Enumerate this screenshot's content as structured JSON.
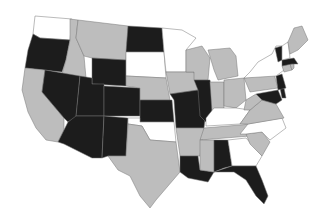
{
  "map": {
    "type": "choropleth",
    "region": "United States (contiguous)",
    "categories": {
      "white": "#ffffff",
      "gray": "#bdbdbd",
      "black": "#1c1c1c"
    },
    "states": [
      {
        "id": "WA",
        "cat": "white",
        "d": "M35,16 L72,19 L70,40 L40,38 L33,34 Z"
      },
      {
        "id": "OR",
        "cat": "black",
        "d": "M33,34 L40,38 L70,40 L66,60 L62,72 L25,68 L28,50 Z"
      },
      {
        "id": "CA",
        "cat": "gray",
        "d": "M25,68 L45,70 L42,92 L64,118 L64,130 L58,142 L46,140 L36,128 L28,112 L22,90 Z"
      },
      {
        "id": "ID",
        "cat": "gray",
        "d": "M70,19 L78,20 L76,38 L84,56 L86,78 L62,74 L66,60 L70,40 Z"
      },
      {
        "id": "NV",
        "cat": "black",
        "d": "M45,70 L80,76 L76,118 L68,122 L64,118 L42,92 Z"
      },
      {
        "id": "MT",
        "cat": "gray",
        "d": "M78,20 L128,26 L126,60 L92,58 L84,56 L76,38 Z"
      },
      {
        "id": "WY",
        "cat": "black",
        "d": "M92,58 L126,60 L126,86 L92,84 Z"
      },
      {
        "id": "UT",
        "cat": "black",
        "d": "M80,76 L92,78 L92,84 L104,84 L104,116 L76,116 Z"
      },
      {
        "id": "AZ",
        "cat": "black",
        "d": "M76,116 L104,116 L102,158 L92,158 L64,144 L58,142 L64,130 L68,122 Z"
      },
      {
        "id": "CO",
        "cat": "black",
        "d": "M104,86 L140,88 L140,116 L104,116 Z"
      },
      {
        "id": "NM",
        "cat": "black",
        "d": "M104,116 L128,118 L126,156 L108,156 L102,158 Z"
      },
      {
        "id": "ND",
        "cat": "black",
        "d": "M128,26 L162,28 L164,52 L126,52 Z"
      },
      {
        "id": "SD",
        "cat": "white",
        "d": "M126,52 L164,52 L166,78 L126,76 Z"
      },
      {
        "id": "NE",
        "cat": "gray",
        "d": "M126,76 L166,78 L170,100 L140,100 L140,88 L126,86 Z"
      },
      {
        "id": "KS",
        "cat": "black",
        "d": "M140,100 L172,100 L174,122 L140,122 Z"
      },
      {
        "id": "OK",
        "cat": "white",
        "d": "M128,118 L140,118 L140,122 L174,122 L176,142 L150,140 L142,126 L128,124 Z"
      },
      {
        "id": "TX",
        "cat": "gray",
        "d": "M128,124 L142,126 L150,140 L176,142 L180,172 L168,186 L156,200 L150,208 L140,196 L130,176 L118,170 L108,156 L126,156 Z"
      },
      {
        "id": "MN",
        "cat": "white",
        "d": "M162,28 L182,30 L196,38 L186,50 L186,72 L166,72 L164,52 Z"
      },
      {
        "id": "IA",
        "cat": "gray",
        "d": "M166,72 L194,72 L198,90 L170,94 Z"
      },
      {
        "id": "MO",
        "cat": "black",
        "d": "M170,94 L198,90 L206,112 L204,128 L176,128 L174,100 Z"
      },
      {
        "id": "AR",
        "cat": "gray",
        "d": "M176,128 L204,128 L200,156 L180,156 Z"
      },
      {
        "id": "LA",
        "cat": "black",
        "d": "M180,156 L198,156 L200,170 L214,172 L208,182 L188,178 L180,172 Z"
      },
      {
        "id": "WI",
        "cat": "gray",
        "d": "M186,50 L202,46 L210,58 L208,80 L194,80 L194,72 L186,72 Z"
      },
      {
        "id": "IL",
        "cat": "black",
        "d": "M194,80 L210,80 L214,108 L208,124 L200,116 L198,90 Z"
      },
      {
        "id": "MI",
        "cat": "gray",
        "d": "M208,50 L230,48 L236,56 L238,76 L218,80 L214,70 Z"
      },
      {
        "id": "IN",
        "cat": "gray",
        "d": "M210,82 L224,82 L224,108 L212,112 Z"
      },
      {
        "id": "OH",
        "cat": "gray",
        "d": "M224,80 L244,78 L246,100 L236,108 L224,106 Z"
      },
      {
        "id": "KY",
        "cat": "white",
        "d": "M206,118 L214,108 L224,108 L236,108 L250,110 L240,124 L206,126 Z"
      },
      {
        "id": "TN",
        "cat": "gray",
        "d": "M204,128 L252,124 L250,136 L200,140 Z"
      },
      {
        "id": "MS",
        "cat": "gray",
        "d": "M200,140 L214,140 L214,172 L200,170 Z"
      },
      {
        "id": "AL",
        "cat": "black",
        "d": "M214,140 L228,140 L232,166 L224,168 L214,172 Z"
      },
      {
        "id": "GA",
        "cat": "white",
        "d": "M228,140 L246,138 L262,156 L256,166 L232,166 Z"
      },
      {
        "id": "FL",
        "cat": "black",
        "d": "M214,172 L232,166 L256,166 L262,180 L268,196 L264,204 L256,196 L246,180 L234,172 Z"
      },
      {
        "id": "SC",
        "cat": "gray",
        "d": "M246,134 L262,132 L270,142 L262,156 L250,144 Z"
      },
      {
        "id": "NC",
        "cat": "white",
        "d": "M248,124 L282,118 L286,128 L270,140 L262,132 L246,134 L240,134 Z"
      },
      {
        "id": "VA",
        "cat": "gray",
        "d": "M240,124 L250,110 L262,100 L276,104 L284,118 L248,124 Z"
      },
      {
        "id": "WV",
        "cat": "gray",
        "d": "M246,100 L256,94 L262,100 L250,110 L244,110 Z"
      },
      {
        "id": "PA",
        "cat": "gray",
        "d": "M244,78 L274,74 L278,88 L250,92 Z"
      },
      {
        "id": "MD",
        "cat": "black",
        "d": "M256,94 L278,90 L282,100 L276,104 L262,100 Z"
      },
      {
        "id": "DE",
        "cat": "black",
        "d": "M280,88 L284,88 L286,98 L282,98 Z"
      },
      {
        "id": "NJ",
        "cat": "black",
        "d": "M276,76 L282,74 L286,88 L278,90 Z"
      },
      {
        "id": "NY",
        "cat": "white",
        "d": "M250,72 L258,62 L272,54 L276,46 L282,46 L284,70 L276,76 L244,78 Z"
      },
      {
        "id": "CT",
        "cat": "gray",
        "d": "M282,66 L290,64 L292,70 L284,72 Z"
      },
      {
        "id": "RI",
        "cat": "gray",
        "d": "M290,64 L294,64 L294,68 L292,70 Z"
      },
      {
        "id": "MA",
        "cat": "black",
        "d": "M282,60 L294,58 L298,64 L292,64 L282,66 Z"
      },
      {
        "id": "VT",
        "cat": "black",
        "d": "M275,48 L282,46 L282,60 L278,62 Z"
      },
      {
        "id": "NH",
        "cat": "white",
        "d": "M282,46 L288,42 L290,58 L282,60 Z"
      },
      {
        "id": "ME",
        "cat": "gray",
        "d": "M288,42 L294,28 L302,26 L308,40 L298,50 L290,54 Z"
      }
    ]
  }
}
